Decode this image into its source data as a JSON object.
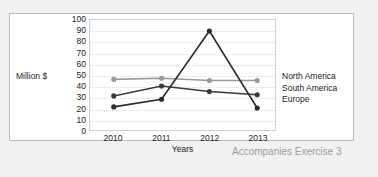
{
  "caption": "Accompanies Exercise 3",
  "legend": {
    "entries": [
      {
        "label": "North America",
        "color": "#9b9b9b"
      },
      {
        "label": "South America",
        "color": "#3a3a3a"
      },
      {
        "label": "Europe",
        "color": "#2b2b2b"
      }
    ]
  },
  "chart_data": {
    "type": "line",
    "title": "",
    "xlabel": "Years",
    "ylabel": "Million $",
    "categories": [
      "2010",
      "2011",
      "2012",
      "2013"
    ],
    "ylim": [
      0,
      100
    ],
    "yticks": [
      100,
      90,
      80,
      70,
      60,
      50,
      40,
      30,
      20,
      10,
      0
    ],
    "grid": true,
    "legend_position": "right",
    "series": [
      {
        "name": "North America",
        "color": "#9b9b9b",
        "values": [
          46,
          47,
          45,
          45
        ]
      },
      {
        "name": "South America",
        "color": "#3a3a3a",
        "values": [
          31,
          40,
          35,
          32
        ]
      },
      {
        "name": "Europe",
        "color": "#2b2b2b",
        "values": [
          21,
          28,
          90,
          20
        ]
      }
    ]
  }
}
